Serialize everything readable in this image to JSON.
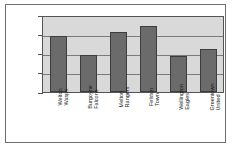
{
  "chart_data": {
    "type": "bar",
    "title": "",
    "xlabel": "",
    "ylabel": "",
    "ylim": [
      0,
      20
    ],
    "yticks": [
      0,
      5,
      10,
      15,
      20
    ],
    "grid": true,
    "legend": "none",
    "categories": [
      "Welton Wasps",
      "Burgoyne Falcons",
      "Melton Rangers",
      "Felston Town",
      "Wellington Eagles",
      "Greentown United"
    ],
    "category_lines": [
      [
        "Welton",
        "Wasps"
      ],
      [
        "Burgoyne",
        "Falcons"
      ],
      [
        "Melton",
        "Rangers"
      ],
      [
        "Felston",
        "Town"
      ],
      [
        "Wellington",
        "Eagles"
      ],
      [
        "Greentown",
        "United"
      ]
    ],
    "values": [
      15,
      10,
      16,
      17.5,
      9.5,
      11.5
    ]
  },
  "colors": {
    "bar_fill": "#6b6b6b",
    "bar_border": "#3d3d3d",
    "plot_background": "#d9d9d9",
    "gridline": "#7a7a7a",
    "axis": "#555555",
    "frame": "#6e6e6e",
    "text": "#1b1b1b"
  }
}
